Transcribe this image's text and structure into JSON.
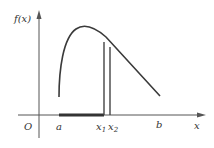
{
  "diagram": {
    "y_axis_label": "f(x)",
    "x_axis_label": "x",
    "origin_label": "O",
    "point_a": "a",
    "point_b": "b",
    "point_x1": "x",
    "point_x1_sub": "1",
    "point_x2": "x",
    "point_x2_sub": "2"
  }
}
